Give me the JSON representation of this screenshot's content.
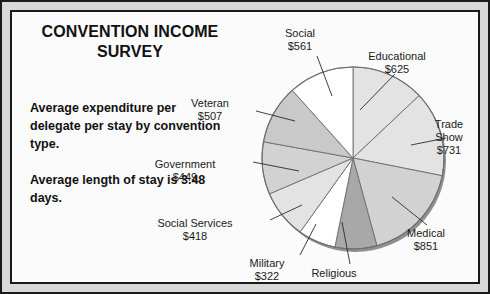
{
  "title": "CONVENTION INCOME\nSURVEY",
  "title_line1": "CONVENTION INCOME",
  "title_line2": "SURVEY",
  "paragraph1": "Average expenditure per delegate per stay by convention type.",
  "paragraph2": "Average length of stay is 3.48 days.",
  "colors": {
    "ink": "#1a1a1a",
    "frame_band": "#d9d9d9",
    "page": "#fbfbfb",
    "slice_white": "#ffffff",
    "slice_light": "#e3e3e3",
    "slice_mid": "#c9c9c9",
    "slice_dark": "#a8a8a8",
    "pie_edge": "#8f8f8f"
  },
  "chart_data": {
    "type": "pie",
    "title": "CONVENTION INCOME SURVEY",
    "subtitle": "Average expenditure per delegate per stay by convention type.",
    "note": "Average length of stay is 3.48 days.",
    "value_prefix": "$",
    "unit": "dollars per delegate per stay",
    "legend": "none",
    "grid": false,
    "total": 4802,
    "start_angle_deg": 0,
    "direction": "clockwise",
    "categories": [
      "Educational",
      "Trade Show",
      "Medical",
      "Religious",
      "Military",
      "Social Services",
      "Government",
      "Veteran",
      "Social"
    ],
    "values": [
      625,
      731,
      851,
      358,
      322,
      418,
      449,
      507,
      561
    ],
    "slices": [
      {
        "label": "Educational",
        "value": 625,
        "value_text": "$625",
        "fill": "#e3e3e3",
        "label_lines": [
          "Educational",
          "$625"
        ],
        "label_x": 385,
        "label_y": 38,
        "leader": [
          [
            383,
            62
          ],
          [
            348,
            98
          ]
        ]
      },
      {
        "label": "Trade Show",
        "value": 731,
        "value_text": "$731",
        "fill": "#e3e3e3",
        "label_lines": [
          "Trade",
          "Show",
          "$731"
        ],
        "label_x": 437,
        "label_y": 106,
        "leader": [
          [
            434,
            126
          ],
          [
            399,
            133
          ]
        ]
      },
      {
        "label": "Medical",
        "value": 851,
        "value_text": "$851",
        "fill": "#d2d2d2",
        "label_lines": [
          "Medical",
          "$851"
        ],
        "label_x": 414,
        "label_y": 215,
        "leader": [
          [
            415,
            213
          ],
          [
            380,
            185
          ]
        ]
      },
      {
        "label": "Religious",
        "value": 358,
        "value_text": "$358",
        "fill": "#a8a8a8",
        "label_lines": [
          "Religious",
          "$358"
        ],
        "label_x": 322,
        "label_y": 255,
        "leader": [
          [
            338,
            252
          ],
          [
            330,
            210
          ]
        ]
      },
      {
        "label": "Military",
        "value": 322,
        "value_text": "$322",
        "fill": "#ffffff",
        "label_lines": [
          "Military",
          "$322"
        ],
        "label_x": 255,
        "label_y": 245,
        "leader": [
          [
            288,
            243
          ],
          [
            304,
            212
          ]
        ]
      },
      {
        "label": "Social Services",
        "value": 418,
        "value_text": "$418",
        "fill": "#e3e3e3",
        "label_lines": [
          "Social Services",
          "$418"
        ],
        "label_x": 183,
        "label_y": 205,
        "leader": [
          [
            258,
            208
          ],
          [
            290,
            193
          ]
        ]
      },
      {
        "label": "Government",
        "value": 449,
        "value_text": "$449",
        "fill": "#d2d2d2",
        "label_lines": [
          "Government",
          "$449"
        ],
        "label_x": 173,
        "label_y": 146,
        "leader": [
          [
            241,
            150
          ],
          [
            287,
            159
          ]
        ]
      },
      {
        "label": "Veteran",
        "value": 507,
        "value_text": "$507",
        "fill": "#c9c9c9",
        "label_lines": [
          "Veteran",
          "$507"
        ],
        "label_x": 198,
        "label_y": 85,
        "leader": [
          [
            244,
            99
          ],
          [
            283,
            109
          ]
        ]
      },
      {
        "label": "Social",
        "value": 561,
        "value_text": "$561",
        "fill": "#ffffff",
        "label_lines": [
          "Social",
          "$561"
        ],
        "label_x": 288,
        "label_y": 15,
        "leader": [
          [
            305,
            44
          ],
          [
            320,
            84
          ]
        ]
      }
    ],
    "geometry": {
      "cx": 341,
      "cy": 146,
      "r": 91
    }
  }
}
